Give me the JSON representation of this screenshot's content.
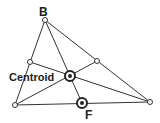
{
  "diagram": {
    "labels": {
      "vertex_b": "B",
      "centroid": "Centroid",
      "point_f": "F"
    },
    "colors": {
      "line": "#333333",
      "text": "#222222",
      "background": "#ffffff"
    }
  }
}
